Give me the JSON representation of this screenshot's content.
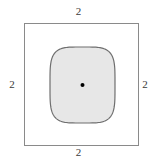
{
  "figure": {
    "canvas": {
      "width": 157,
      "height": 167,
      "background": "#ffffff"
    },
    "outer_square": {
      "name": "outer-square",
      "x": 24,
      "y": 23,
      "width": 115,
      "height": 123,
      "stroke": "#8a8a8a",
      "stroke_width": 1,
      "fill": "none"
    },
    "squircle": {
      "name": "inner-squircle",
      "x": 50,
      "y": 47,
      "width": 65,
      "height": 76,
      "fill": "#e7e7e7",
      "stroke": "#6f6f6f",
      "stroke_width": 1.2
    },
    "center_dot": {
      "name": "center-point",
      "cx": 82.5,
      "cy": 85,
      "r": 2,
      "fill": "#000000"
    },
    "labels": {
      "top": "2",
      "right": "2",
      "bottom": "2",
      "left": "2"
    },
    "label_color": "#3a3a3a"
  }
}
